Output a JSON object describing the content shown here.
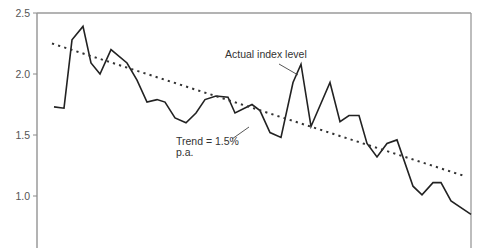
{
  "chart_data": {
    "type": "line",
    "title": "",
    "xlabel": "",
    "ylabel": "",
    "ylim": [
      0.65,
      2.5
    ],
    "yticks": [
      {
        "value": 2.5,
        "label": "2.5"
      },
      {
        "value": 2.0,
        "label": "2.0"
      },
      {
        "value": 1.5,
        "label": "1.5"
      },
      {
        "value": 1.0,
        "label": "1.0"
      }
    ],
    "grid": false,
    "legend": "none",
    "series": [
      {
        "name": "Actual index level",
        "style": "solid",
        "color": "#222222",
        "points": [
          [
            54,
            1.73
          ],
          [
            64,
            1.72
          ],
          [
            72,
            2.28
          ],
          [
            83,
            2.39
          ],
          [
            91,
            2.09
          ],
          [
            100,
            2.0
          ],
          [
            111,
            2.2
          ],
          [
            127,
            2.09
          ],
          [
            137,
            1.95
          ],
          [
            147,
            1.77
          ],
          [
            157,
            1.79
          ],
          [
            165,
            1.77
          ],
          [
            175,
            1.64
          ],
          [
            186,
            1.6
          ],
          [
            196,
            1.68
          ],
          [
            205,
            1.79
          ],
          [
            216,
            1.82
          ],
          [
            228,
            1.81
          ],
          [
            235,
            1.68
          ],
          [
            252,
            1.75
          ],
          [
            260,
            1.7
          ],
          [
            270,
            1.52
          ],
          [
            281,
            1.48
          ],
          [
            293,
            1.93
          ],
          [
            301,
            2.08
          ],
          [
            311,
            1.57
          ],
          [
            330,
            1.93
          ],
          [
            340,
            1.61
          ],
          [
            349,
            1.66
          ],
          [
            359,
            1.66
          ],
          [
            367,
            1.43
          ],
          [
            377,
            1.32
          ],
          [
            387,
            1.43
          ],
          [
            397,
            1.46
          ],
          [
            413,
            1.08
          ],
          [
            422,
            1.01
          ],
          [
            433,
            1.11
          ],
          [
            441,
            1.11
          ],
          [
            451,
            0.96
          ],
          [
            471,
            0.85
          ]
        ]
      },
      {
        "name": "Trend = 1.5% p.a.",
        "style": "dotted",
        "color": "#333333",
        "points": [
          [
            52,
            2.25
          ],
          [
            466,
            1.16
          ]
        ]
      }
    ],
    "annotations": [
      {
        "text_lines": [
          "Actual index level"
        ],
        "text_x": 225,
        "text_y": 58,
        "leader": [
          [
            279,
            64
          ],
          [
            298,
            75
          ]
        ]
      },
      {
        "text_lines": [
          "Trend = 1.5%",
          "p.a."
        ],
        "text_x": 176,
        "text_y": 145,
        "leader": [
          [
            232,
            139
          ],
          [
            249,
            127
          ]
        ]
      }
    ]
  }
}
